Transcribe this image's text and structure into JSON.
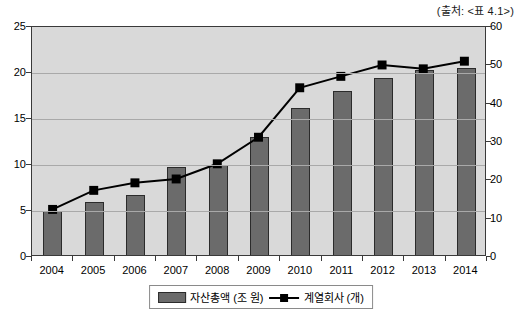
{
  "source_note": "(출처: <표 4.1>)",
  "legend": {
    "bar_label": "자산총액 (조 원)",
    "line_label": "계열회사 (개)"
  },
  "chart_data": {
    "type": "bar",
    "title": "",
    "subtitle": "",
    "xlabel": "",
    "ylabel": "",
    "grid": true,
    "legend_position": "bottom",
    "categories": [
      "2004",
      "2005",
      "2006",
      "2007",
      "2008",
      "2009",
      "2010",
      "2011",
      "2012",
      "2013",
      "2014"
    ],
    "axes": {
      "left": {
        "label": "자산총액 (조 원)",
        "min": 0,
        "max": 25,
        "ticks": [
          0,
          5,
          10,
          15,
          20,
          25
        ]
      },
      "right": {
        "label": "계열회사 (개)",
        "min": 0,
        "max": 60,
        "ticks": [
          0,
          10,
          20,
          30,
          40,
          50,
          60
        ]
      }
    },
    "series": [
      {
        "name": "자산총액 (조 원)",
        "type": "bar",
        "axis": "left",
        "color": "#6b6b6b",
        "values": [
          5.0,
          6.0,
          6.7,
          9.8,
          10.0,
          13.0,
          16.2,
          18.0,
          19.5,
          20.3,
          20.5
        ]
      },
      {
        "name": "계열회사 (개)",
        "type": "line",
        "axis": "right",
        "color": "#000000",
        "marker": "square",
        "values": [
          12,
          17,
          19,
          20,
          24,
          31,
          44,
          47,
          50,
          49,
          51
        ]
      }
    ]
  }
}
